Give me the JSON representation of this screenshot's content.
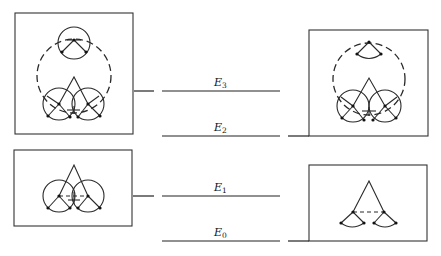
{
  "diagram": {
    "type": "energy-level diagram with molecular configuration insets",
    "levels": [
      {
        "id": "E3",
        "symbol": "E",
        "subscript": "3",
        "y": 91
      },
      {
        "id": "E2",
        "symbol": "E",
        "subscript": "2",
        "y": 136
      },
      {
        "id": "E1",
        "symbol": "E",
        "subscript": "1",
        "y": 196
      },
      {
        "id": "E0",
        "symbol": "E",
        "subscript": "0",
        "y": 241
      }
    ],
    "insets": [
      {
        "position": "top-left",
        "connects_to": "E3",
        "description": "three full circles (top + two bottom) with triangle and large dashed circle"
      },
      {
        "position": "bottom-left",
        "connects_to": "E1",
        "description": "two full circles with triangle, dashed bond between centers"
      },
      {
        "position": "top-right",
        "connects_to": "E2",
        "description": "top wedge arc, large dashed circle, two full bottom circles with triangle"
      },
      {
        "position": "bottom-right",
        "connects_to": "E0",
        "description": "triangle with two wedge arcs, dashed bond between centers"
      }
    ],
    "colors": {
      "line": "#222222",
      "background": "#ffffff"
    }
  }
}
